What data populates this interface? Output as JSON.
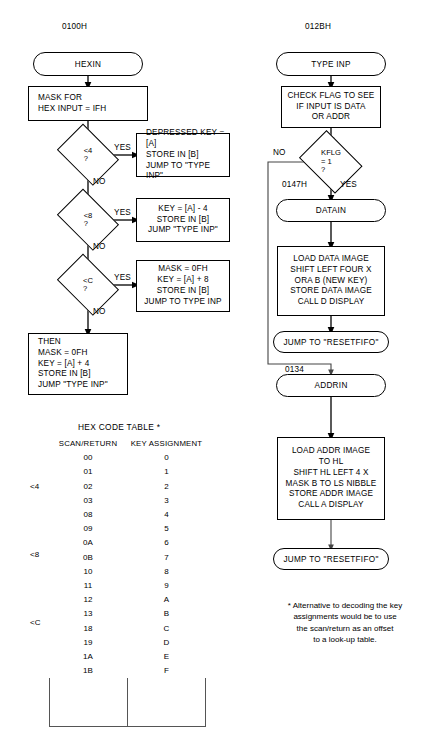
{
  "left_flow": {
    "address_label": "0100H",
    "start": "HEXIN",
    "mask_box": "MASK FOR\nHEX INPUT = IFH",
    "decisions": [
      {
        "text": "<4\n?",
        "yes": "YES",
        "no": "NO"
      },
      {
        "text": "<8\n?",
        "yes": "YES",
        "no": "NO"
      },
      {
        "text": "<C\n?",
        "yes": "YES",
        "no": "NO"
      }
    ],
    "yes_boxes": [
      "DEPRESSED KEY = [A]\nSTORE IN [B]\nJUMP TO \"TYPE INP\"",
      "KEY = [A] - 4\nSTORE IN [B]\nJUMP \"TYPE INP\"",
      "MASK = 0FH\nKEY = [A] + 8\nSTORE IN [B]\nJUMP TO TYPE INP"
    ],
    "then_box": "THEN\nMASK = 0FH\nKEY = [A] + 4\nSTORE IN [B]\nJUMP \"TYPE INP\""
  },
  "right_flow": {
    "address_label": "012BH",
    "start": "TYPE INP",
    "check_box": "CHECK FLAG TO SEE\nIF INPUT IS DATA\nOR ADDR",
    "decision": {
      "text": "KFLG\n= 1\n?",
      "yes": "YES",
      "no": "NO"
    },
    "datain_address": "0147H",
    "datain": "DATAIN",
    "data_box": "LOAD DATA IMAGE\nSHIFT LEFT FOUR X\nORA  B  (NEW  KEY)\nSTORE DATA IMAGE\nCALL D DISPLAY",
    "data_jump": "JUMP TO \"RESETFIFO\"",
    "addrin_address": "0134",
    "addrin": "ADDRIN",
    "addr_box": "LOAD ADDR IMAGE\nTO HL\nSHIFT HL LEFT 4 X\nMASK B TO LS NIBBLE\nSTORE ADDR IMAGE\nCALL A DISPLAY",
    "addr_jump": "JUMP TO \"RESETFIFO\""
  },
  "hex_table": {
    "title": "HEX CODE TABLE *",
    "headers": [
      "SCAN/RETURN",
      "KEY  ASSIGNMENT"
    ],
    "group_labels": [
      "<4",
      "<8",
      "<C"
    ],
    "rows": [
      [
        "00",
        "0"
      ],
      [
        "01",
        "1"
      ],
      [
        "02",
        "2"
      ],
      [
        "03",
        "3"
      ],
      [
        "08",
        "4"
      ],
      [
        "09",
        "5"
      ],
      [
        "0A",
        "6"
      ],
      [
        "0B",
        "7"
      ],
      [
        "10",
        "8"
      ],
      [
        "11",
        "9"
      ],
      [
        "12",
        "A"
      ],
      [
        "13",
        "B"
      ],
      [
        "18",
        "C"
      ],
      [
        "19",
        "D"
      ],
      [
        "1A",
        "E"
      ],
      [
        "1B",
        "F"
      ]
    ]
  },
  "footnote": "* Alternative to decoding the key\nassignments would be to use\nthe scan/return as an offset\nto a look-up table.",
  "colors": {
    "ink": "#000000",
    "table_rule": "#555555",
    "background": "#ffffff"
  }
}
